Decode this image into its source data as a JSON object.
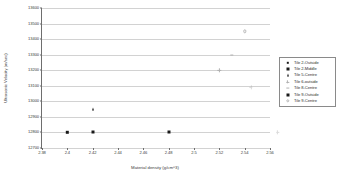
{
  "chart_data": {
    "type": "scatter",
    "title": "",
    "xlabel": "Material density (g/cm^3)",
    "ylabel": "Ultrasonic Velocity (m/sec)",
    "xlim": [
      2.38,
      2.56
    ],
    "ylim": [
      12700,
      13600
    ],
    "xticks": [
      "2.38",
      "2.4",
      "2.42",
      "2.44",
      "2.46",
      "2.48",
      "2.5",
      "2.52",
      "2.54",
      "2.56"
    ],
    "yticks": [
      "13600",
      "13500",
      "13400",
      "13300",
      "13200",
      "13100",
      "13000",
      "12900",
      "12800",
      "12700"
    ],
    "grid": true,
    "legend_position": "right",
    "series": [
      {
        "name": "Tile 2-Outside",
        "marker": "square-sm",
        "color": "#1a1a1a",
        "points": [
          {
            "x": 2.4,
            "y": 12800
          }
        ]
      },
      {
        "name": "Tile 2-Middle",
        "marker": "square",
        "color": "#1a1a1a",
        "points": [
          {
            "x": 2.42,
            "y": 12800
          }
        ]
      },
      {
        "name": "Tile 5-Centre",
        "marker": "triangle",
        "color": "#1a1a1a",
        "points": [
          {
            "x": 2.42,
            "y": 12950
          }
        ]
      },
      {
        "name": "Tile 6-outside",
        "marker": "plus",
        "color": "#b0b0b0",
        "points": [
          {
            "x": 2.52,
            "y": 13200
          }
        ]
      },
      {
        "name": "Tile 8-Centre",
        "marker": "dash",
        "color": "#b0b0b0",
        "points": [
          {
            "x": 2.53,
            "y": 13300
          }
        ]
      },
      {
        "name": "Tile 9-Outside",
        "marker": "square",
        "color": "#1a1a1a",
        "points": [
          {
            "x": 2.48,
            "y": 12800
          }
        ]
      },
      {
        "name": "Tile 9-Centre",
        "marker": "circle-open",
        "color": "#b9b9b9",
        "points": [
          {
            "x": 2.54,
            "y": 13450
          }
        ]
      }
    ],
    "extra_marks": [
      {
        "name": "faint-mark-right",
        "marker": "plus",
        "x": 2.545,
        "y": 13090
      },
      {
        "name": "faint-mark-offplot",
        "marker": "plus",
        "x": 2.566,
        "y": 12800
      }
    ]
  }
}
